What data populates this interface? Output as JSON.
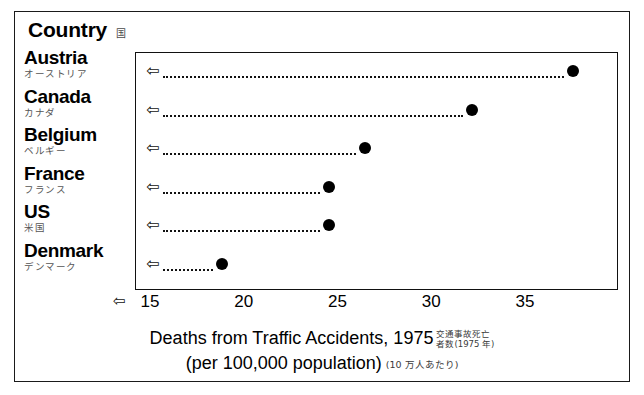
{
  "header": {
    "title": "Country",
    "title_jp": "国"
  },
  "axis": {
    "arrow_glyph": "⇦",
    "ticks": [
      15,
      20,
      25,
      30,
      35
    ],
    "min": 15,
    "max": 35
  },
  "rows": [
    {
      "name": "Austria",
      "name_jp": "オーストリア",
      "value": 37.5,
      "arrow_glyph": "⇦"
    },
    {
      "name": "Canada",
      "name_jp": "カナダ",
      "value": 32.1,
      "arrow_glyph": "⇦"
    },
    {
      "name": "Belgium",
      "name_jp": "ベルギー",
      "value": 26.4,
      "arrow_glyph": "⇦"
    },
    {
      "name": "France",
      "name_jp": "フランス",
      "value": 24.5,
      "arrow_glyph": "⇦"
    },
    {
      "name": "US",
      "name_jp": "米国",
      "value": 24.5,
      "arrow_glyph": "⇦"
    },
    {
      "name": "Denmark",
      "name_jp": "デンマーク",
      "value": 18.8,
      "arrow_glyph": "⇦"
    }
  ],
  "caption": {
    "line1": "Deaths from Traffic Accidents, 1975",
    "line1_jp_1": "交通事故死亡",
    "line1_jp_2": "者数(1975 年)",
    "line2": "(per 100,000 population)",
    "line2_jp": "(10 万人あたり)"
  },
  "chart_data": {
    "type": "scatter",
    "xlabel": "Deaths from Traffic Accidents, 1975 (per 100,000 population)",
    "ylabel": "Country",
    "categories": [
      "Austria",
      "Canada",
      "Belgium",
      "France",
      "US",
      "Denmark"
    ],
    "values": [
      37.5,
      32.1,
      26.4,
      24.5,
      24.5,
      18.8
    ],
    "xlim": [
      15,
      35
    ],
    "xticks": [
      15,
      20,
      25,
      30,
      35
    ],
    "grid": false,
    "legend": "none",
    "orientation": "horizontal",
    "marker": "filled-circle",
    "connector": "dotted-leader-line"
  },
  "colors": {
    "marker": "#000000",
    "frame": "#111111",
    "text": "#000000",
    "annotation": "#555555"
  }
}
